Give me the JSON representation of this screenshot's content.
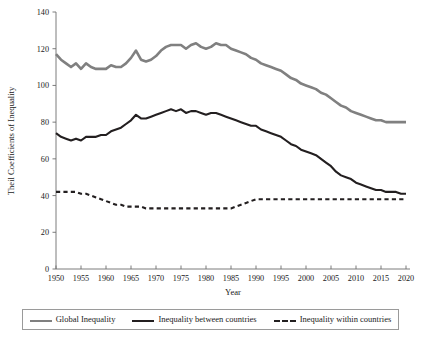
{
  "chart_data": {
    "type": "line",
    "title": "",
    "xlabel": "Year",
    "ylabel": "Theil Coefficients of Inequality",
    "xlim": [
      1950,
      2020
    ],
    "ylim": [
      0,
      140
    ],
    "grid": false,
    "legend_position": "bottom",
    "xticks": [
      1950,
      1955,
      1960,
      1965,
      1970,
      1975,
      1980,
      1985,
      1990,
      1995,
      2000,
      2005,
      2010,
      2015,
      2020
    ],
    "yticks": [
      0,
      20,
      40,
      60,
      80,
      100,
      120,
      140
    ],
    "x": [
      1950,
      1951,
      1952,
      1953,
      1954,
      1955,
      1956,
      1957,
      1958,
      1959,
      1960,
      1961,
      1962,
      1963,
      1964,
      1965,
      1966,
      1967,
      1968,
      1969,
      1970,
      1971,
      1972,
      1973,
      1974,
      1975,
      1976,
      1977,
      1978,
      1979,
      1980,
      1981,
      1982,
      1983,
      1984,
      1985,
      1986,
      1987,
      1988,
      1989,
      1990,
      1991,
      1992,
      1993,
      1994,
      1995,
      1996,
      1997,
      1998,
      1999,
      2000,
      2001,
      2002,
      2003,
      2004,
      2005,
      2006,
      2007,
      2008,
      2009,
      2010,
      2011,
      2012,
      2013,
      2014,
      2015,
      2016,
      2017,
      2018,
      2019,
      2020
    ],
    "series": [
      {
        "name": "Global Inequality",
        "color": "#808080",
        "style": "solid",
        "width": 2.6,
        "values": [
          117,
          114,
          112,
          110,
          112,
          109,
          112,
          110,
          109,
          109,
          109,
          111,
          110,
          110,
          112,
          115,
          119,
          114,
          113,
          114,
          116,
          119,
          121,
          122,
          122,
          122,
          120,
          122,
          123,
          121,
          120,
          121,
          123,
          122,
          122,
          120,
          119,
          118,
          117,
          115,
          114,
          112,
          111,
          110,
          109,
          108,
          106,
          104,
          103,
          101,
          100,
          99,
          98,
          96,
          95,
          93,
          91,
          89,
          88,
          86,
          85,
          84,
          83,
          82,
          81,
          81,
          80,
          80,
          80,
          80,
          80
        ]
      },
      {
        "name": "Inequality between countries",
        "color": "#231f20",
        "style": "solid",
        "width": 2.1,
        "values": [
          74,
          72,
          71,
          70,
          71,
          70,
          72,
          72,
          72,
          73,
          73,
          75,
          76,
          77,
          79,
          81,
          84,
          82,
          82,
          83,
          84,
          85,
          86,
          87,
          86,
          87,
          85,
          86,
          86,
          85,
          84,
          85,
          85,
          84,
          83,
          82,
          81,
          80,
          79,
          78,
          78,
          76,
          75,
          74,
          73,
          72,
          70,
          68,
          67,
          65,
          64,
          63,
          62,
          60,
          58,
          56,
          53,
          51,
          50,
          49,
          47,
          46,
          45,
          44,
          43,
          43,
          42,
          42,
          42,
          41,
          41
        ]
      },
      {
        "name": "Inequality within countries",
        "color": "#231f20",
        "style": "dashed",
        "width": 2.1,
        "values": [
          42,
          42,
          42,
          42,
          42,
          41,
          41,
          40,
          39,
          38,
          37,
          36,
          35,
          35,
          34,
          34,
          34,
          34,
          33,
          33,
          33,
          33,
          33,
          33,
          33,
          33,
          33,
          33,
          33,
          33,
          33,
          33,
          33,
          33,
          33,
          33,
          34,
          35,
          36,
          37,
          38,
          38,
          38,
          38,
          38,
          38,
          38,
          38,
          38,
          38,
          38,
          38,
          38,
          38,
          38,
          38,
          38,
          38,
          38,
          38,
          38,
          38,
          38,
          38,
          38,
          38,
          38,
          38,
          38,
          38,
          38
        ]
      }
    ]
  },
  "legend": {
    "items": [
      {
        "label": "Global Inequality"
      },
      {
        "label": "Inequality between countries"
      },
      {
        "label": "Inequality within countries"
      }
    ]
  }
}
